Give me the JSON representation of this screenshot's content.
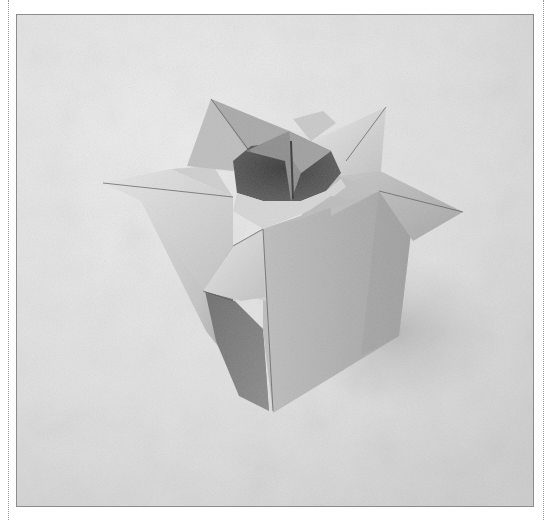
{
  "image": {
    "subject": "origami vase",
    "description": "Black-and-white photograph of a folded paper vase with four pointed flaps around the opening, on a mottled light-gray backdrop",
    "colors": {
      "page_background": "#ffffff",
      "frame_border": "#8c8c8c",
      "backdrop_light": "#ececec",
      "backdrop_dark": "#cfcfcf",
      "paper_light": "#d8d8d8",
      "paper_mid": "#b4b4b4",
      "paper_dark": "#8a8a8a",
      "interior_shadow": "#4a4a4a"
    },
    "frame": {
      "x": 16,
      "y": 14,
      "width": 517,
      "height": 492
    }
  }
}
